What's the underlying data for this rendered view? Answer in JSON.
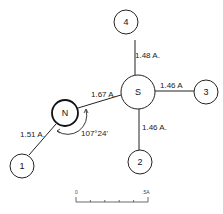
{
  "atoms": {
    "S": "S",
    "N": "N",
    "a1": "1",
    "a2": "2",
    "a3": "3",
    "a4": "4"
  },
  "bonds": {
    "S_4": "1.48 A.",
    "S_3": "1.46 A",
    "S_2": "1.46 A.",
    "S_N": "1.67 A.",
    "N_1": "1.51 A."
  },
  "angle": {
    "label": "107°24'"
  },
  "scale_bar": {
    "start": "0",
    "end": ".5A",
    "ticks": 6
  },
  "colors": {
    "line": "#222222",
    "background": "#ffffff"
  }
}
